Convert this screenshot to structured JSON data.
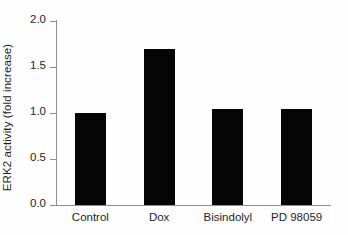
{
  "chart_data": {
    "type": "bar",
    "title": "",
    "subtitle": "",
    "xlabel": "",
    "ylabel": "ERK2 activity (fold increase)",
    "categories": [
      "Control",
      "Dox",
      "Bisindolyl",
      "PD 98059"
    ],
    "values": [
      1.0,
      1.7,
      1.04,
      1.04
    ],
    "series": [
      {
        "name": "ERK2 activity",
        "values": [
          1.0,
          1.7,
          1.04,
          1.04
        ],
        "color": "#050505"
      }
    ],
    "ylim": [
      0.0,
      2.0
    ],
    "yticks": [
      0.0,
      0.5,
      1.0,
      1.5,
      2.0
    ],
    "ytick_labels": [
      "0.0",
      "0.5",
      "1.0",
      "1.5",
      "2.0"
    ],
    "grid": false,
    "legend": null,
    "legend_position": "none",
    "annotations": [],
    "bar_color": "#050505",
    "axis_color": "#8e8e8e",
    "background_color": "#fefefe",
    "text_color": "#1e1e1e"
  }
}
